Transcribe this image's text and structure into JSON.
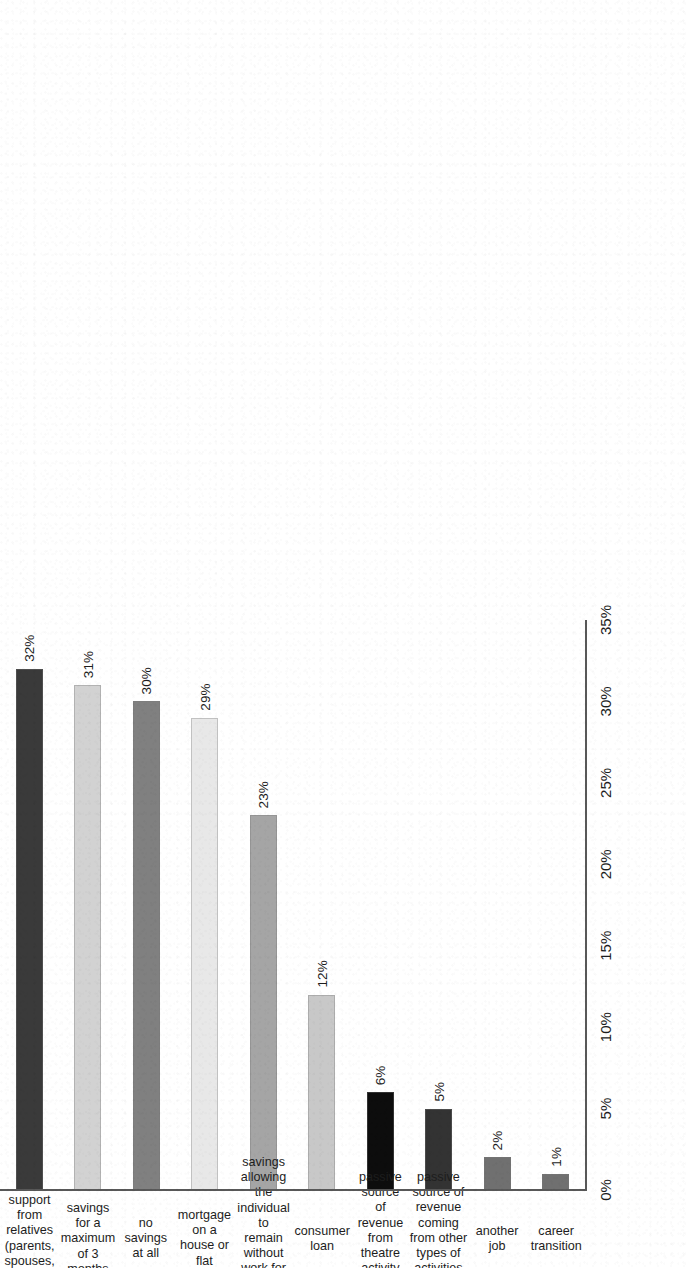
{
  "chart_data": {
    "type": "bar",
    "orientation": "horizontal",
    "title": "",
    "subtitle": "",
    "xlabel": "",
    "ylabel": "",
    "xlim": [
      0,
      35
    ],
    "xtick_labels": [
      "0%",
      "5%",
      "10%",
      "15%",
      "20%",
      "25%",
      "30%",
      "35%"
    ],
    "xtick_values": [
      0,
      5,
      10,
      15,
      20,
      25,
      30,
      35
    ],
    "grid": false,
    "legend": false,
    "value_suffix": "%",
    "categories": [
      "support from\nrelatives (parents,\nspouses, partners)",
      "savings for a\nmaximum of 3\nmonths",
      "no savings\nat all",
      "mortgage on a\nhouse or flat",
      "savings allowing\nthe individual to\nremain without\nwork for more\nthan 3 months",
      "consumer\nloan",
      "passive source\nof revenue from\ntheatre activity\n(copyright,\nroyalties)",
      "passive source of\nrevenue coming\nfrom other\ntypes of activities\n(stocks, dividends)",
      "another job",
      "career transition"
    ],
    "values": [
      32,
      31,
      30,
      29,
      23,
      12,
      6,
      5,
      2,
      1
    ],
    "value_labels": [
      "32%",
      "31%",
      "30%",
      "29%",
      "23%",
      "12%",
      "6%",
      "5%",
      "2%",
      "1%"
    ],
    "bar_colors": [
      "#3a3a3a",
      "#d2d2d2",
      "#808080",
      "#e8e8e8",
      "#a5a5a5",
      "#c8c8c8",
      "#0d0d0d",
      "#333333",
      "#707070",
      "#707070"
    ],
    "axis_color": "#585858"
  }
}
